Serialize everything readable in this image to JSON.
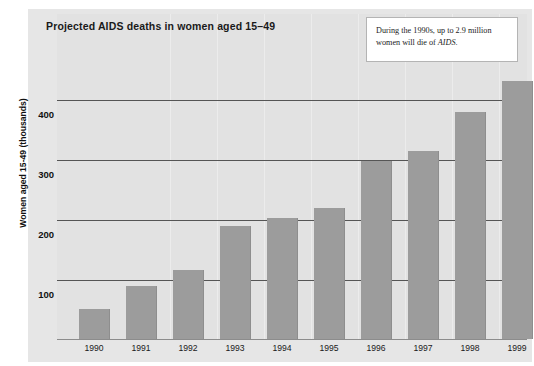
{
  "chart_data": {
    "type": "bar",
    "title": "Projected AIDS deaths in women aged 15–49",
    "xlabel": "",
    "ylabel": "Women aged 15-49 (thousands)",
    "categories": [
      "1990",
      "1991",
      "1992",
      "1993",
      "1994",
      "1995",
      "1996",
      "1997",
      "1998",
      "1999"
    ],
    "values": [
      50,
      88,
      115,
      188,
      202,
      218,
      297,
      313,
      378,
      430
    ],
    "series": [
      {
        "name": "Projected AIDS deaths in women aged 15-49 (thousands)",
        "values": [
          50,
          88,
          115,
          188,
          202,
          218,
          297,
          313,
          378,
          430
        ]
      }
    ],
    "yticks": [
      100,
      200,
      300,
      400
    ],
    "ytick_labels": [
      "100",
      "200",
      "300",
      "400"
    ],
    "ylim": [
      0,
      460
    ],
    "grid": "horizontal",
    "legend": "none",
    "annotations": [
      {
        "name": "callout-box",
        "text_before_italic": "During the 1990s, up to 2.9 million women will die of ",
        "italic_word": "AIDS",
        "text_after_italic": "."
      }
    ],
    "bar_color": "#9c9c9c",
    "plot_background": "#e2e2e2",
    "panel_background": "#e6e6e6",
    "gridline_color": "#555555"
  },
  "annotation": {
    "line1_pre": "During the 1990s, up to 2.9 million",
    "line2_pre": "women will die of ",
    "line2_italic": "AIDS",
    "line2_post": "."
  },
  "axis": {
    "y_title": "Women aged 15-49 (thousands)",
    "y_tick_400": "400",
    "y_tick_300": "300",
    "y_tick_200": "200",
    "y_tick_100": "100",
    "x_1990": "1990",
    "x_1991": "1991",
    "x_1992": "1992",
    "x_1993": "1993",
    "x_1994": "1994",
    "x_1995": "1995",
    "x_1996": "1996",
    "x_1997": "1997",
    "x_1998": "1998",
    "x_1999": "1999"
  },
  "header": {
    "title": "Projected AIDS deaths in women aged 15–49"
  }
}
